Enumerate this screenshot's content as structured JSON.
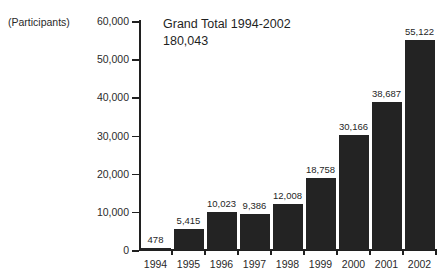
{
  "unit_caption": "(Participants)",
  "annotation": {
    "line1": "Grand Total 1994-2002",
    "line2": "180,043"
  },
  "axis": {
    "y_ticks": [
      "0",
      "10,000",
      "20,000",
      "30,000",
      "40,000",
      "50,000",
      "60,000"
    ]
  },
  "chart_data": {
    "type": "bar",
    "title": "Grand Total 1994-2002",
    "subtitle": "180,043",
    "xlabel": "",
    "ylabel": "(Participants)",
    "ylim": [
      0,
      60000
    ],
    "ytick_values": [
      0,
      10000,
      20000,
      30000,
      40000,
      50000,
      60000
    ],
    "ytick_labels": [
      "0",
      "10,000",
      "20,000",
      "30,000",
      "40,000",
      "50,000",
      "60,000"
    ],
    "grid": false,
    "legend": "none",
    "bar_color": "#232323",
    "categories": [
      "1994",
      "1995",
      "1996",
      "1997",
      "1998",
      "1999",
      "2000",
      "2001",
      "2002"
    ],
    "values": [
      478,
      5415,
      10023,
      9386,
      12008,
      18758,
      30166,
      38687,
      55122
    ],
    "value_labels": [
      "478",
      "5,415",
      "10,023",
      "9,386",
      "12,008",
      "18,758",
      "30,166",
      "38,687",
      "55,122"
    ],
    "total": 180043
  }
}
